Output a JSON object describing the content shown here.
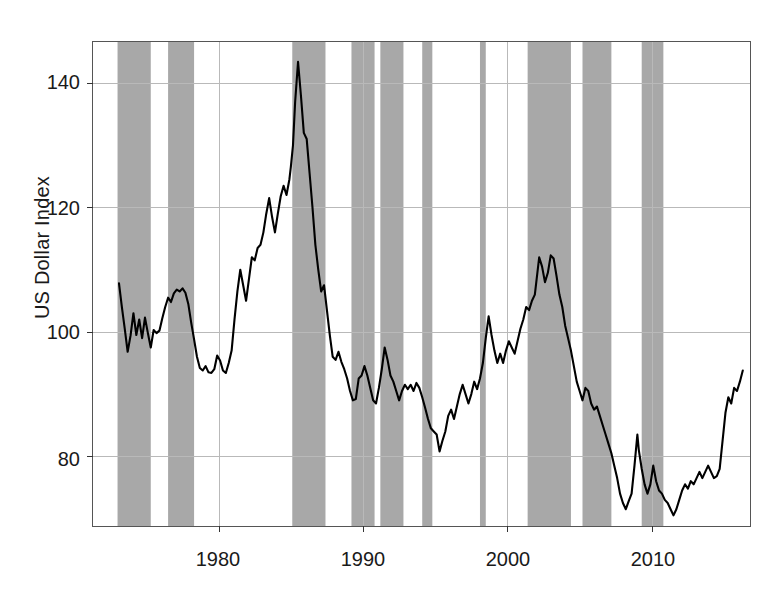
{
  "chart_data": {
    "type": "line",
    "title": "",
    "xlabel": "",
    "ylabel": "US Dollar Index",
    "xlim": [
      1971.3,
      2016.8
    ],
    "ylim": [
      68.8,
      146.6
    ],
    "xticks": [
      1980,
      1990,
      2000,
      2010
    ],
    "xticklabels": [
      "1980",
      "1990",
      "2000",
      "2010"
    ],
    "yticks": [
      80,
      100,
      120,
      140
    ],
    "yticklabels": [
      "80",
      "100",
      "120",
      "140"
    ],
    "grid": true,
    "legend": "none",
    "line_color": "#000000",
    "band_color": "#a8a8a8",
    "grid_color": "#b9b9b9",
    "shaded_bands_label": "recession / shaded periods",
    "shaded_bands": [
      [
        1973.0,
        1975.3
      ],
      [
        1976.5,
        1978.3
      ],
      [
        1985.1,
        1987.4
      ],
      [
        1989.2,
        1990.8
      ],
      [
        1991.2,
        1992.8
      ],
      [
        1994.1,
        1994.8
      ],
      [
        1998.1,
        1998.5
      ],
      [
        2001.4,
        2004.4
      ],
      [
        2005.2,
        2007.2
      ],
      [
        2009.3,
        2010.8
      ]
    ],
    "series": [
      {
        "name": "US Dollar Index",
        "x": [
          1973.1,
          1973.3,
          1973.5,
          1973.7,
          1973.9,
          1974.1,
          1974.3,
          1974.5,
          1974.7,
          1974.9,
          1975.1,
          1975.3,
          1975.5,
          1975.7,
          1975.9,
          1976.1,
          1976.3,
          1976.5,
          1976.7,
          1976.9,
          1977.1,
          1977.3,
          1977.5,
          1977.7,
          1977.9,
          1978.1,
          1978.3,
          1978.5,
          1978.7,
          1978.9,
          1979.1,
          1979.3,
          1979.5,
          1979.7,
          1979.9,
          1980.1,
          1980.3,
          1980.5,
          1980.7,
          1980.9,
          1981.1,
          1981.3,
          1981.5,
          1981.7,
          1981.9,
          1982.1,
          1982.3,
          1982.5,
          1982.7,
          1982.9,
          1983.1,
          1983.3,
          1983.5,
          1983.7,
          1983.9,
          1984.1,
          1984.3,
          1984.5,
          1984.7,
          1984.9,
          1985.0,
          1985.15,
          1985.3,
          1985.5,
          1985.7,
          1985.9,
          1986.1,
          1986.3,
          1986.5,
          1986.7,
          1986.9,
          1987.1,
          1987.3,
          1987.5,
          1987.7,
          1987.9,
          1988.1,
          1988.3,
          1988.5,
          1988.7,
          1988.9,
          1989.1,
          1989.3,
          1989.5,
          1989.7,
          1989.9,
          1990.1,
          1990.3,
          1990.5,
          1990.7,
          1990.9,
          1991.1,
          1991.3,
          1991.5,
          1991.7,
          1991.9,
          1992.1,
          1992.3,
          1992.5,
          1992.7,
          1992.9,
          1993.1,
          1993.3,
          1993.5,
          1993.7,
          1993.9,
          1994.1,
          1994.3,
          1994.5,
          1994.7,
          1994.9,
          1995.1,
          1995.3,
          1995.5,
          1995.7,
          1995.9,
          1996.1,
          1996.3,
          1996.5,
          1996.7,
          1996.9,
          1997.1,
          1997.3,
          1997.5,
          1997.7,
          1997.9,
          1998.1,
          1998.3,
          1998.5,
          1998.7,
          1998.9,
          1999.1,
          1999.3,
          1999.5,
          1999.7,
          1999.9,
          2000.1,
          2000.3,
          2000.5,
          2000.7,
          2000.9,
          2001.1,
          2001.3,
          2001.5,
          2001.7,
          2001.9,
          2002.0,
          2002.2,
          2002.4,
          2002.6,
          2002.8,
          2003.0,
          2003.2,
          2003.4,
          2003.6,
          2003.8,
          2004.0,
          2004.2,
          2004.4,
          2004.6,
          2004.8,
          2005.0,
          2005.2,
          2005.4,
          2005.6,
          2005.8,
          2006.0,
          2006.2,
          2006.4,
          2006.6,
          2006.8,
          2007.0,
          2007.2,
          2007.4,
          2007.6,
          2007.8,
          2008.0,
          2008.2,
          2008.4,
          2008.6,
          2008.8,
          2009.0,
          2009.1,
          2009.3,
          2009.5,
          2009.7,
          2009.9,
          2010.1,
          2010.3,
          2010.5,
          2010.7,
          2010.9,
          2011.1,
          2011.3,
          2011.5,
          2011.7,
          2011.9,
          2012.1,
          2012.3,
          2012.5,
          2012.7,
          2012.9,
          2013.1,
          2013.3,
          2013.5,
          2013.7,
          2013.9,
          2014.1,
          2014.3,
          2014.5,
          2014.7,
          2014.9,
          2015.1,
          2015.3,
          2015.5,
          2015.7,
          2015.9,
          2016.1,
          2016.3
        ],
        "y": [
          107.8,
          104.0,
          100.5,
          96.8,
          99.4,
          103.0,
          99.5,
          102.0,
          99.0,
          102.3,
          99.8,
          97.5,
          100.3,
          99.8,
          100.2,
          102.2,
          104.0,
          105.5,
          104.8,
          106.2,
          106.8,
          106.5,
          107.0,
          106.3,
          104.5,
          101.5,
          98.8,
          96.0,
          94.2,
          93.8,
          94.5,
          93.5,
          93.4,
          94.0,
          96.2,
          95.4,
          93.8,
          93.4,
          95.0,
          97.0,
          102.0,
          106.5,
          110.0,
          107.5,
          105.0,
          108.5,
          112.0,
          111.5,
          113.5,
          114.0,
          116.0,
          119.0,
          121.5,
          118.5,
          116.0,
          119.0,
          121.8,
          123.5,
          122.0,
          124.5,
          126.5,
          130.0,
          137.0,
          143.4,
          138.0,
          132.0,
          131.0,
          125.5,
          120.0,
          114.0,
          110.0,
          106.5,
          107.5,
          103.5,
          99.5,
          96.0,
          95.5,
          96.8,
          95.2,
          94.0,
          92.5,
          90.5,
          89.0,
          89.2,
          92.5,
          93.0,
          94.5,
          93.0,
          91.0,
          89.0,
          88.5,
          91.0,
          94.0,
          97.5,
          95.5,
          93.0,
          92.0,
          90.5,
          89.0,
          90.5,
          91.5,
          90.8,
          91.5,
          90.5,
          91.8,
          91.0,
          89.5,
          87.8,
          86.0,
          84.5,
          84.0,
          83.5,
          80.8,
          82.5,
          84.0,
          86.5,
          87.5,
          86.0,
          88.0,
          90.0,
          91.5,
          90.0,
          88.5,
          90.0,
          92.0,
          90.8,
          92.5,
          95.0,
          99.0,
          102.5,
          99.5,
          97.0,
          95.0,
          96.5,
          95.0,
          97.0,
          98.5,
          97.5,
          96.5,
          98.5,
          100.5,
          102.0,
          104.0,
          103.5,
          105.0,
          106.0,
          108.0,
          112.0,
          110.5,
          108.0,
          109.5,
          112.3,
          111.8,
          109.0,
          106.0,
          104.0,
          101.0,
          99.0,
          97.0,
          94.5,
          92.0,
          90.5,
          89.0,
          91.0,
          90.5,
          88.5,
          87.5,
          88.0,
          86.5,
          85.0,
          83.5,
          82.0,
          80.5,
          78.5,
          76.5,
          74.0,
          72.5,
          71.5,
          72.8,
          74.0,
          78.5,
          83.5,
          81.0,
          78.0,
          75.5,
          74.0,
          75.5,
          78.5,
          76.0,
          74.5,
          74.0,
          73.0,
          72.5,
          71.5,
          70.5,
          71.5,
          73.0,
          74.5,
          75.5,
          74.8,
          76.0,
          75.5,
          76.5,
          77.5,
          76.5,
          77.5,
          78.5,
          77.5,
          76.5,
          76.8,
          78.0,
          82.5,
          87.0,
          89.5,
          88.5,
          91.0,
          90.5,
          92.0,
          93.8
        ]
      }
    ]
  },
  "axis": {
    "ylabel_text": "US Dollar Index"
  }
}
